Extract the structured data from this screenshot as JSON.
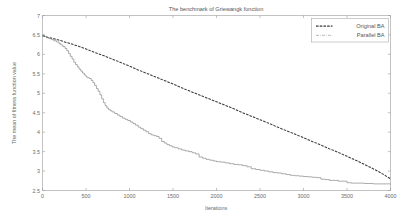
{
  "chart_data": {
    "type": "line",
    "title": "The benchmark of Griewangk function",
    "xlabel": "Iterations",
    "ylabel": "The mean of fitness function value",
    "xlim": [
      0,
      4000
    ],
    "ylim": [
      2.5,
      7
    ],
    "xticks": [
      0,
      500,
      1000,
      1500,
      2000,
      2500,
      3000,
      3500,
      4000
    ],
    "xticklabels": [
      "0",
      "500",
      "1000",
      "1500",
      "2000",
      "2500",
      "3000",
      "3500",
      "4000"
    ],
    "yticks": [
      2.5,
      3,
      3.5,
      4,
      4.5,
      5,
      5.5,
      6,
      6.5,
      7
    ],
    "yticklabels": [
      "2.5",
      "3",
      "3.5",
      "4",
      "4.5",
      "5",
      "5.5",
      "6",
      "6.5",
      "7"
    ],
    "grid": false,
    "legend_position": "upper right",
    "legend": [
      "Original BA",
      "Parallel BA"
    ],
    "series": [
      {
        "name": "Original BA",
        "style": "dashed",
        "color": "#3b3b3b",
        "x": [
          0,
          60,
          120,
          200,
          300,
          400,
          500,
          600,
          700,
          800,
          900,
          1000,
          1100,
          1200,
          1300,
          1400,
          1500,
          1600,
          1700,
          1800,
          1900,
          2000,
          2100,
          2200,
          2300,
          2400,
          2500,
          2600,
          2700,
          2800,
          2900,
          3000,
          3100,
          3200,
          3300,
          3400,
          3500,
          3600,
          3700,
          3800,
          3900,
          4000
        ],
        "y": [
          6.48,
          6.44,
          6.41,
          6.36,
          6.29,
          6.22,
          6.14,
          6.05,
          5.97,
          5.88,
          5.79,
          5.7,
          5.6,
          5.51,
          5.42,
          5.33,
          5.24,
          5.14,
          5.05,
          4.96,
          4.87,
          4.78,
          4.69,
          4.6,
          4.5,
          4.41,
          4.32,
          4.23,
          4.13,
          4.04,
          3.95,
          3.86,
          3.76,
          3.67,
          3.57,
          3.48,
          3.38,
          3.28,
          3.17,
          3.06,
          2.94,
          2.8
        ]
      },
      {
        "name": "Parallel BA",
        "style": "stepped",
        "color": "#7a7a7a",
        "x": [
          0,
          20,
          45,
          70,
          100,
          130,
          160,
          190,
          210,
          235,
          260,
          280,
          300,
          320,
          340,
          360,
          380,
          400,
          420,
          440,
          460,
          480,
          500,
          520,
          540,
          560,
          580,
          600,
          620,
          640,
          660,
          680,
          700,
          720,
          740,
          760,
          780,
          800,
          830,
          860,
          890,
          920,
          950,
          980,
          1010,
          1040,
          1070,
          1100,
          1130,
          1160,
          1190,
          1220,
          1250,
          1280,
          1310,
          1340,
          1370,
          1400,
          1430,
          1460,
          1490,
          1520,
          1560,
          1600,
          1640,
          1680,
          1720,
          1760,
          1800,
          1840,
          1880,
          1920,
          1960,
          2000,
          2050,
          2100,
          2150,
          2200,
          2250,
          2300,
          2350,
          2400,
          2450,
          2500,
          2550,
          2600,
          2650,
          2700,
          2750,
          2800,
          2850,
          2900,
          2950,
          3000,
          3050,
          3100,
          3150,
          3200,
          3250,
          3300,
          3400,
          3500,
          3550,
          3600,
          3700,
          3800,
          3900,
          4000
        ],
        "y": [
          6.5,
          6.46,
          6.43,
          6.41,
          6.38,
          6.35,
          6.32,
          6.28,
          6.24,
          6.2,
          6.15,
          6.09,
          6.02,
          5.95,
          5.88,
          5.8,
          5.74,
          5.68,
          5.62,
          5.57,
          5.52,
          5.47,
          5.42,
          5.4,
          5.38,
          5.33,
          5.27,
          5.2,
          5.12,
          5.05,
          4.96,
          4.86,
          4.76,
          4.68,
          4.62,
          4.58,
          4.55,
          4.52,
          4.48,
          4.44,
          4.4,
          4.36,
          4.33,
          4.3,
          4.26,
          4.22,
          4.18,
          4.13,
          4.09,
          4.05,
          4.01,
          3.96,
          3.93,
          3.91,
          3.89,
          3.84,
          3.76,
          3.72,
          3.68,
          3.65,
          3.62,
          3.6,
          3.57,
          3.54,
          3.52,
          3.5,
          3.47,
          3.44,
          3.36,
          3.33,
          3.3,
          3.28,
          3.26,
          3.24,
          3.23,
          3.21,
          3.19,
          3.17,
          3.16,
          3.14,
          3.11,
          3.06,
          3.04,
          3.02,
          3.0,
          2.98,
          2.96,
          2.95,
          2.93,
          2.91,
          2.89,
          2.88,
          2.87,
          2.86,
          2.85,
          2.84,
          2.83,
          2.79,
          2.78,
          2.76,
          2.74,
          2.7,
          2.69,
          2.69,
          2.68,
          2.67,
          2.67,
          2.66
        ]
      }
    ]
  }
}
